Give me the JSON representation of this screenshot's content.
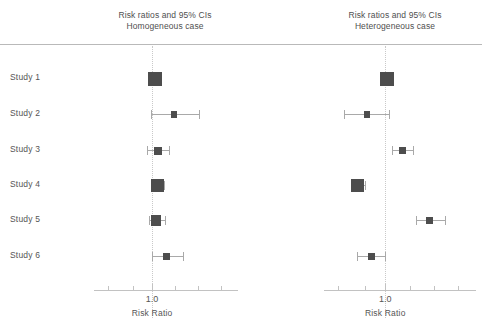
{
  "figure": {
    "background": "#ffffff",
    "marker_color": "#4d4d4d",
    "ci_color": "#a9a9a9",
    "refline_color": "#c9c9c9",
    "axis_color": "#c2c2c2",
    "rule_color": "#b9b9b9",
    "text_color": "#555555"
  },
  "study_labels": [
    "Study  1",
    "Study  2",
    "Study  3",
    "Study  4",
    "Study  5",
    "Study  6"
  ],
  "chart_data": [
    {
      "type": "scatter",
      "subtype": "forest-plot",
      "panel_id": "homogeneous",
      "title": "Risk ratios and 95% CIs",
      "subtitle": "Homogeneous case",
      "xlabel": "Risk Ratio",
      "ylabel": "",
      "xscale": "log",
      "xlim": [
        0.55,
        2.5
      ],
      "xticks": [
        0.6,
        0.8,
        1.0,
        1.3,
        1.7,
        2.2
      ],
      "xtick_labels": [
        "",
        "",
        "1.0",
        "",
        "",
        ""
      ],
      "reference_line": 1.0,
      "grid": false,
      "legend": "none",
      "categories": [
        "Study  1",
        "Study  2",
        "Study  3",
        "Study  4",
        "Study  5",
        "Study  6"
      ],
      "values": [
        1.03,
        1.29,
        1.07,
        1.06,
        1.05,
        1.18
      ],
      "ci_low": [
        0.98,
        0.99,
        0.94,
        1.0,
        0.97,
        1.0
      ],
      "ci_high": [
        1.09,
        1.72,
        1.22,
        1.14,
        1.16,
        1.42
      ],
      "weights": [
        1.0,
        0.22,
        0.4,
        0.92,
        0.62,
        0.34
      ]
    },
    {
      "type": "scatter",
      "subtype": "forest-plot",
      "panel_id": "heterogeneous",
      "title": "Risk ratios and 95% CIs",
      "subtitle": "Heterogeneous case",
      "xlabel": "Risk Ratio",
      "ylabel": "",
      "xscale": "log",
      "xlim": [
        0.55,
        2.5
      ],
      "xticks": [
        0.6,
        0.8,
        1.0,
        1.3,
        1.7,
        2.2
      ],
      "xtick_labels": [
        "",
        "",
        "1.0",
        "",
        "",
        ""
      ],
      "reference_line": 1.0,
      "grid": false,
      "legend": "none",
      "categories": [
        "Study  1",
        "Study  2",
        "Study  3",
        "Study  4",
        "Study  5",
        "Study  6"
      ],
      "values": [
        1.02,
        0.82,
        1.2,
        0.74,
        1.62,
        0.86
      ],
      "ci_low": [
        0.96,
        0.64,
        1.07,
        0.69,
        1.4,
        0.74
      ],
      "ci_high": [
        1.08,
        1.04,
        1.35,
        0.8,
        1.9,
        1.0
      ],
      "weights": [
        1.0,
        0.24,
        0.32,
        0.98,
        0.28,
        0.3
      ]
    }
  ],
  "axis": {
    "tick_value_label": "1.0",
    "caption": "Risk Ratio"
  }
}
